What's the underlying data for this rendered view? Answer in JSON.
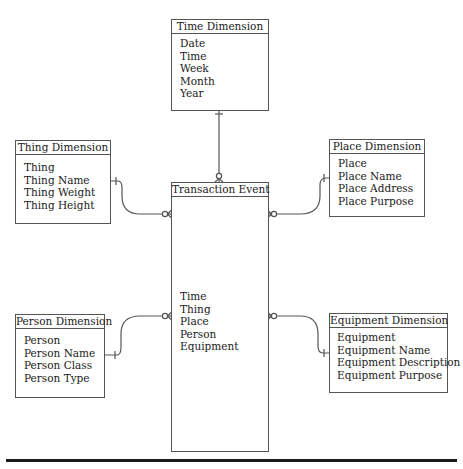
{
  "diagram": {
    "type": "star-schema-erd",
    "fact": {
      "title": "Transaction Event",
      "attributes": [
        "Time",
        "Thing",
        "Place",
        "Person",
        "Equipment"
      ]
    },
    "dimensions": {
      "time": {
        "title": "Time Dimension",
        "attributes": [
          "Date",
          "Time",
          "Week",
          "Month",
          "Year"
        ]
      },
      "thing": {
        "title": "Thing Dimension",
        "attributes": [
          "Thing",
          "Thing Name",
          "Thing Weight",
          "Thing Height"
        ]
      },
      "place": {
        "title": "Place Dimension",
        "attributes": [
          "Place",
          "Place Name",
          "Place Address",
          "Place Purpose"
        ]
      },
      "person": {
        "title": "Person Dimension",
        "attributes": [
          "Person",
          "Person Name",
          "Person Class",
          "Person Type"
        ]
      },
      "equipment": {
        "title": "Equipment Dimension",
        "attributes": [
          "Equipment",
          "Equipment Name",
          "Equipment Description",
          "Equipment Purpose"
        ]
      }
    },
    "relationships": [
      {
        "from": "Time Dimension",
        "to": "Transaction Event",
        "from_end": "one",
        "to_end": "zero-or-many"
      },
      {
        "from": "Thing Dimension",
        "to": "Transaction Event",
        "from_end": "one",
        "to_end": "zero-or-many"
      },
      {
        "from": "Place Dimension",
        "to": "Transaction Event",
        "from_end": "one",
        "to_end": "zero-or-many"
      },
      {
        "from": "Person Dimension",
        "to": "Transaction Event",
        "from_end": "one",
        "to_end": "zero-or-many"
      },
      {
        "from": "Equipment Dimension",
        "to": "Transaction Event",
        "from_end": "one",
        "to_end": "zero-or-many"
      }
    ],
    "colors": {
      "line": "#555555",
      "text": "#1a1a1a",
      "rule": "#1a1a1a"
    }
  }
}
